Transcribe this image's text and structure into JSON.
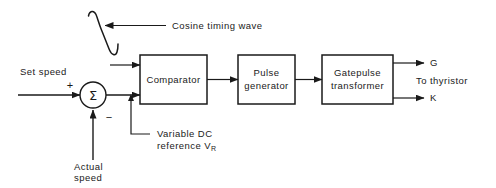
{
  "diagram": {
    "stroke_color": "#1a1a1a",
    "background_color": "#ffffff"
  },
  "labels": {
    "cosine_timing_wave": "Cosine  timing  wave",
    "set_speed": "Set speed",
    "plus_sign": "+",
    "minus_sign": "−",
    "sigma_symbol": "Σ",
    "actual_speed_line1": "Actual",
    "actual_speed_line2": "speed",
    "variable_dc_line1": "Variable  DC",
    "variable_dc_line2_prefix": "reference  V",
    "variable_dc_line2_subscript": "R",
    "output_g": "G",
    "output_k": "K",
    "to_thyristor": "To  thyristor"
  },
  "blocks": [
    {
      "id": "comparator",
      "label": "Comparator",
      "x": 140,
      "y": 55,
      "w": 67,
      "h": 49
    },
    {
      "id": "pulse-generator",
      "label_line1": "Pulse",
      "label_line2": "generator",
      "x": 238,
      "y": 55,
      "w": 57,
      "h": 49
    },
    {
      "id": "gatepulse-transformer",
      "label_line1": "Gatepulse",
      "label_line2": "transformer",
      "x": 322,
      "y": 55,
      "w": 71,
      "h": 49
    }
  ],
  "summing_junction": {
    "cx": 93,
    "cy": 95,
    "r": 13
  }
}
